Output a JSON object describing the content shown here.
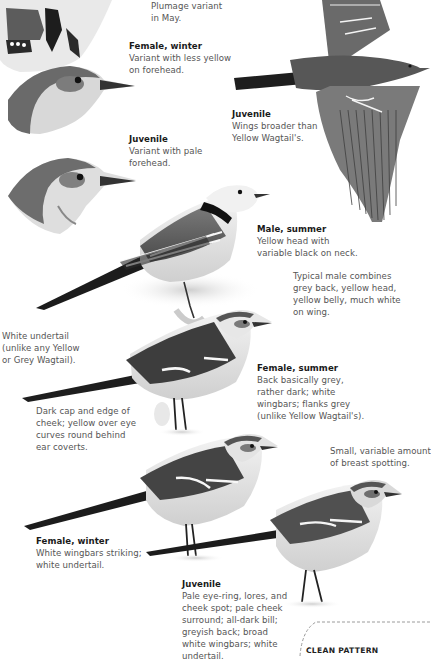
{
  "plate": {
    "species": "White Wagtail",
    "palette": {
      "ink": "#1a1a1a",
      "text": "#555555",
      "dark": "#262626",
      "mid": "#6e6e6e",
      "light": "#bdbdbd",
      "paper": "#ffffff"
    }
  },
  "annotations": [
    {
      "id": "plumage-variant",
      "title": "",
      "body": "Plumage variant\nin May."
    },
    {
      "id": "female-winter-head",
      "title": "Female, winter",
      "body": "Variant with less yellow\non forehead."
    },
    {
      "id": "juvenile-head",
      "title": "Juvenile",
      "body": "Variant with pale\nforehead."
    },
    {
      "id": "juvenile-flight",
      "title": "Juvenile",
      "body": "Wings broader than\nYellow Wagtail's."
    },
    {
      "id": "male-summer",
      "title": "Male, summer",
      "body": "Yellow head with\nvariable black on neck."
    },
    {
      "id": "typical-male",
      "title": "",
      "body": "Typical male combines\ngrey back, yellow head,\nyellow belly, much white\non wing."
    },
    {
      "id": "white-undertail",
      "title": "",
      "body": "White undertail\n(unlike any Yellow\nor Grey Wagtail)."
    },
    {
      "id": "female-summer",
      "title": "Female, summer",
      "body": "Back basically grey,\nrather dark; white\nwingbars; flanks grey\n(unlike Yellow Wagtail's)."
    },
    {
      "id": "dark-cap",
      "title": "",
      "body": "Dark cap and edge of\ncheek; yellow over eye\ncurves round behind\near coverts."
    },
    {
      "id": "breast-spotting",
      "title": "",
      "body": "Small, variable amount\nof breast spotting."
    },
    {
      "id": "female-winter",
      "title": "Female, winter",
      "body": "White wingbars striking;\nwhite undertail."
    },
    {
      "id": "juvenile-standing",
      "title": "Juvenile",
      "body": "Pale eye-ring, lores, and\ncheek spot; pale cheek\nsurround; all-dark bill;\ngreyish back; broad\nwhite wingbars; white\nundertail."
    }
  ],
  "callout_box": {
    "label": "CLEAN PATTERN"
  },
  "illustrations": [
    {
      "id": "head-variant-may",
      "alt": "head, plumage variant in May"
    },
    {
      "id": "head-female-winter",
      "alt": "female winter head"
    },
    {
      "id": "head-juvenile",
      "alt": "juvenile head"
    },
    {
      "id": "flight-juvenile",
      "alt": "juvenile in flight"
    },
    {
      "id": "bird-male-summer",
      "alt": "male summer standing"
    },
    {
      "id": "bird-female-summer",
      "alt": "female summer standing"
    },
    {
      "id": "bird-female-winter",
      "alt": "female winter standing"
    },
    {
      "id": "bird-juvenile",
      "alt": "juvenile standing"
    }
  ]
}
